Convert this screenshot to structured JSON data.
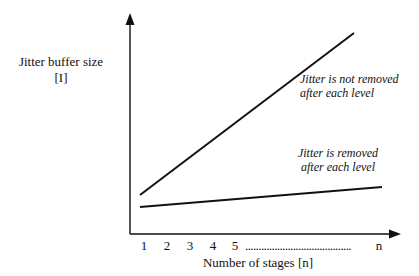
{
  "chart_data": {
    "type": "line",
    "title": "",
    "xlabel": "Number of stages [n]",
    "ylabel": "Jitter buffer size [I]",
    "ylabel_lines": [
      "Jitter buffer size",
      "[I]"
    ],
    "x_ticks": [
      "1",
      "2",
      "3",
      "4",
      "5",
      "n"
    ],
    "x_tick_ellipsis": "........................................",
    "grid": false,
    "legend": null,
    "axes_units": "qualitative (no numeric y scale)",
    "series": [
      {
        "name": "Jitter is not removed after each level",
        "annotation_lines": [
          "Jitter is not removed",
          "after each level"
        ],
        "x": [
          1,
          "n"
        ],
        "y_relative": [
          0.2,
          1.0
        ],
        "pixel_points": [
          [
            140,
            195
          ],
          [
            354,
            33
          ]
        ],
        "color": "#111111"
      },
      {
        "name": "Jitter is removed after each level",
        "annotation_lines": [
          "Jitter is removed",
          "after each level"
        ],
        "x": [
          1,
          "n"
        ],
        "y_relative": [
          0.12,
          0.23
        ],
        "pixel_points": [
          [
            140,
            207
          ],
          [
            382,
            187
          ]
        ],
        "color": "#111111"
      }
    ]
  }
}
